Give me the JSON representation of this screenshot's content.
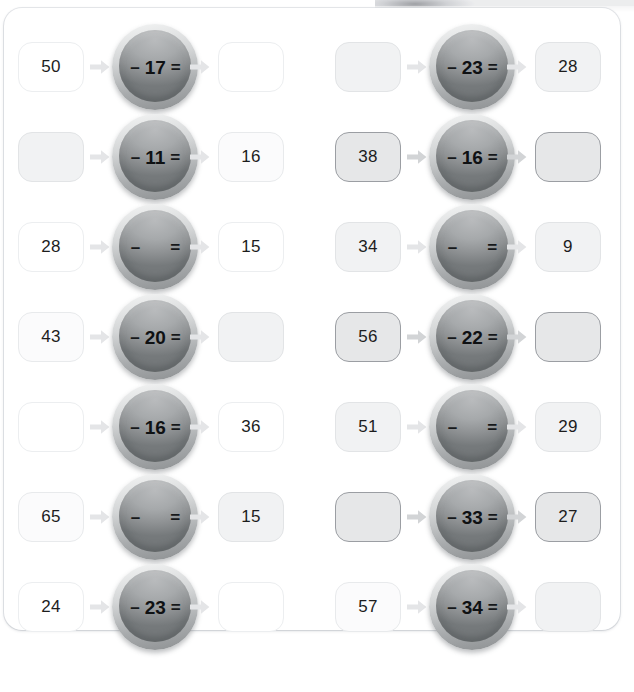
{
  "page": {
    "arrow_icon": "right-arrow-icon",
    "minus_sign": "–",
    "equals_sign": "=",
    "colors": {
      "page_background": "#ffffff",
      "card_background": "#ffffff",
      "box_white_fill": "#ffffff",
      "box_faint_fill": "#fbfbfc",
      "box_light_fill": "#f1f2f3",
      "box_dark_fill": "#e6e7e8",
      "box_dark_border": "#9b9ea3",
      "circle_face": "#8e9193",
      "circle_rim": "#d4d6d7",
      "arrow_light": "#e4e5e7",
      "arrow_dark": "#d2d4d6",
      "text": "#1d1d1d"
    }
  },
  "rows": [
    {
      "left": {
        "input": "50",
        "input_shade": "white",
        "operand": "17",
        "output": "",
        "output_shade": "white",
        "arrow_shade": "light"
      },
      "right": {
        "input": "",
        "input_shade": "light",
        "operand": "23",
        "output": "28",
        "output_shade": "light",
        "arrow_shade": "light"
      }
    },
    {
      "left": {
        "input": "",
        "input_shade": "light",
        "operand": "11",
        "output": "16",
        "output_shade": "faint",
        "arrow_shade": "light"
      },
      "right": {
        "input": "38",
        "input_shade": "dark",
        "operand": "16",
        "output": "",
        "output_shade": "dark",
        "arrow_shade": "dark"
      }
    },
    {
      "left": {
        "input": "28",
        "input_shade": "white",
        "operand": "",
        "output": "15",
        "output_shade": "white",
        "arrow_shade": "light"
      },
      "right": {
        "input": "34",
        "input_shade": "light",
        "operand": "",
        "output": "9",
        "output_shade": "light",
        "arrow_shade": "light"
      }
    },
    {
      "left": {
        "input": "43",
        "input_shade": "faint",
        "operand": "20",
        "output": "",
        "output_shade": "light",
        "arrow_shade": "light"
      },
      "right": {
        "input": "56",
        "input_shade": "dark",
        "operand": "22",
        "output": "",
        "output_shade": "dark",
        "arrow_shade": "dark"
      }
    },
    {
      "left": {
        "input": "",
        "input_shade": "white",
        "operand": "16",
        "output": "36",
        "output_shade": "white",
        "arrow_shade": "light"
      },
      "right": {
        "input": "51",
        "input_shade": "light",
        "operand": "",
        "output": "29",
        "output_shade": "light",
        "arrow_shade": "light"
      }
    },
    {
      "left": {
        "input": "65",
        "input_shade": "faint",
        "operand": "",
        "output": "15",
        "output_shade": "light",
        "arrow_shade": "light"
      },
      "right": {
        "input": "",
        "input_shade": "dark",
        "operand": "33",
        "output": "27",
        "output_shade": "dark",
        "arrow_shade": "dark"
      }
    },
    {
      "left": {
        "input": "24",
        "input_shade": "white",
        "operand": "23",
        "output": "",
        "output_shade": "white",
        "arrow_shade": "light"
      },
      "right": {
        "input": "57",
        "input_shade": "faint",
        "operand": "34",
        "output": "",
        "output_shade": "light",
        "arrow_shade": "light"
      }
    }
  ]
}
